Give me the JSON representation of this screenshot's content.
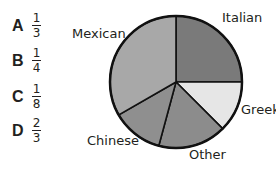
{
  "choices": [
    {
      "letter": "A",
      "numerator": "1",
      "denominator": "3"
    },
    {
      "letter": "B",
      "numerator": "1",
      "denominator": "4"
    },
    {
      "letter": "C",
      "numerator": "1",
      "denominator": "8"
    },
    {
      "letter": "D",
      "numerator": "2",
      "denominator": "3"
    }
  ],
  "chart_data": {
    "type": "pie",
    "title": "",
    "categories": [
      "Italian",
      "Greek",
      "Other",
      "Chinese",
      "Mexican"
    ],
    "values": [
      0.25,
      0.125,
      0.167,
      0.125,
      0.333
    ],
    "colors": [
      "#7a7a7a",
      "#e6e6e6",
      "#8c8c8c",
      "#8f8f8f",
      "#a8a8a8"
    ],
    "start_angle_deg": 0,
    "direction": "clockwise",
    "legend": "none (direct labels)"
  }
}
